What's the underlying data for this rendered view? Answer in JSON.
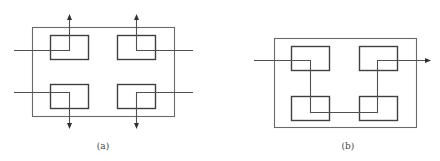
{
  "figures": [
    {
      "id": "a",
      "caption": "(a)",
      "description": "Four blocks inside enclosure, each with independent input from side and output via top/bottom arrows (parallel flow)",
      "frame": {
        "x": 32,
        "y": 27,
        "w": 142,
        "h": 90
      },
      "boxes": [
        {
          "name": "top-left",
          "x": 50,
          "y": 35,
          "w": 39,
          "h": 25
        },
        {
          "name": "top-right",
          "x": 117,
          "y": 35,
          "w": 39,
          "h": 25
        },
        {
          "name": "bottom-left",
          "x": 50,
          "y": 84,
          "w": 39,
          "h": 25
        },
        {
          "name": "bottom-right",
          "x": 117,
          "y": 84,
          "w": 39,
          "h": 25
        }
      ]
    },
    {
      "id": "b",
      "caption": "(b)",
      "description": "Four blocks inside enclosure connected in series by a single path entering left and exiting right with arrow",
      "frame": {
        "x": 274,
        "y": 38,
        "w": 142,
        "h": 90
      },
      "boxes": [
        {
          "name": "top-left",
          "x": 291,
          "y": 46,
          "w": 39,
          "h": 25
        },
        {
          "name": "top-right",
          "x": 359,
          "y": 46,
          "w": 39,
          "h": 25
        },
        {
          "name": "bottom-left",
          "x": 291,
          "y": 96,
          "w": 39,
          "h": 25
        },
        {
          "name": "bottom-right",
          "x": 359,
          "y": 96,
          "w": 39,
          "h": 25
        }
      ]
    }
  ],
  "colors": {
    "frame": "#6a6a6a",
    "box": "#404040",
    "wire": "#505050",
    "caption": "#444444",
    "background": "#ffffff"
  }
}
